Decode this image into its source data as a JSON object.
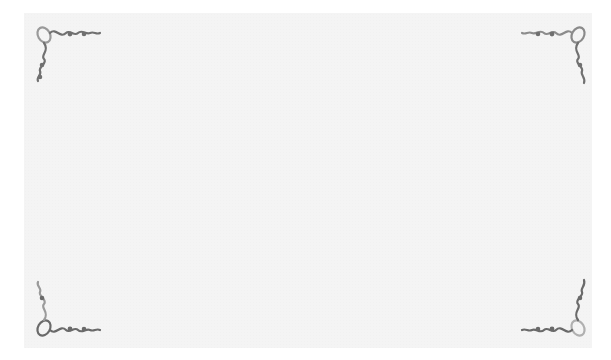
{
  "card": {
    "background_color": "#f4f4f4",
    "ornament_color": "#6e6e6e",
    "corners": [
      {
        "position": "top-left",
        "icon": "flourish-icon"
      },
      {
        "position": "top-right",
        "icon": "flourish-icon"
      },
      {
        "position": "bottom-left",
        "icon": "flourish-icon"
      },
      {
        "position": "bottom-right",
        "icon": "flourish-icon"
      }
    ]
  }
}
